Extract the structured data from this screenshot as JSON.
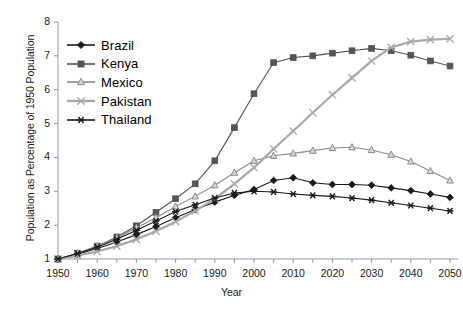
{
  "chart_data": {
    "type": "line",
    "title": "",
    "xlabel": "Year",
    "ylabel": "Population as Percentage of 1950 Population",
    "xlim": [
      1950,
      2050
    ],
    "ylim": [
      1,
      8
    ],
    "xticks": [
      1950,
      1960,
      1970,
      1980,
      1990,
      2000,
      2010,
      2020,
      2030,
      2040,
      2050
    ],
    "yticks": [
      1,
      2,
      3,
      4,
      5,
      6,
      7,
      8
    ],
    "grid": false,
    "legend_position": "upper-left-inside",
    "x": [
      1950,
      1955,
      1960,
      1965,
      1970,
      1975,
      1980,
      1985,
      1990,
      1995,
      2000,
      2005,
      2010,
      2015,
      2020,
      2025,
      2030,
      2035,
      2040,
      2045,
      2050
    ],
    "series": [
      {
        "name": "Brazil",
        "color": "#1a1a1a",
        "marker": "diamond",
        "values": [
          1.0,
          1.14,
          1.31,
          1.5,
          1.72,
          1.96,
          2.22,
          2.46,
          2.68,
          2.88,
          3.05,
          3.32,
          3.4,
          3.25,
          3.2,
          3.2,
          3.18,
          3.1,
          3.02,
          2.92,
          2.82
        ]
      },
      {
        "name": "Kenya",
        "color": "#555555",
        "marker": "square",
        "values": [
          1.0,
          1.17,
          1.38,
          1.65,
          1.98,
          2.38,
          2.78,
          3.22,
          3.9,
          4.88,
          5.88,
          6.8,
          6.95,
          7.0,
          7.08,
          7.15,
          7.22,
          7.15,
          7.02,
          6.85,
          6.7
        ]
      },
      {
        "name": "Mexico",
        "color": "#8a8a8a",
        "marker": "triangle",
        "values": [
          1.0,
          1.17,
          1.38,
          1.62,
          1.92,
          2.22,
          2.55,
          2.85,
          3.18,
          3.55,
          3.9,
          4.05,
          4.12,
          4.2,
          4.28,
          4.3,
          4.22,
          4.08,
          3.88,
          3.6,
          3.32
        ]
      },
      {
        "name": "Pakistan",
        "color": "#a8a8a8",
        "marker": "cross",
        "values": [
          1.0,
          1.1,
          1.22,
          1.38,
          1.58,
          1.82,
          2.1,
          2.42,
          2.78,
          3.22,
          3.7,
          4.25,
          4.78,
          5.32,
          5.85,
          6.35,
          6.85,
          7.25,
          7.42,
          7.48,
          7.5
        ]
      },
      {
        "name": "Thailand",
        "color": "#1a1a1a",
        "marker": "star",
        "values": [
          1.0,
          1.16,
          1.35,
          1.58,
          1.85,
          2.12,
          2.4,
          2.6,
          2.8,
          2.95,
          3.0,
          2.98,
          2.92,
          2.88,
          2.85,
          2.8,
          2.74,
          2.66,
          2.58,
          2.5,
          2.42
        ]
      }
    ]
  }
}
